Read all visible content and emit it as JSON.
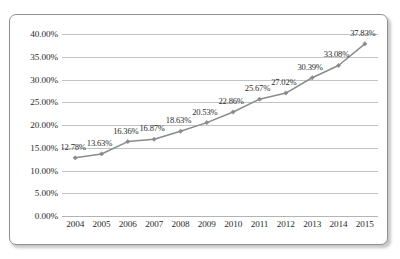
{
  "chart_data": {
    "type": "line",
    "title": "",
    "subtitle": "",
    "xlabel": "",
    "ylabel": "",
    "categories": [
      "2004",
      "2005",
      "2006",
      "2007",
      "2008",
      "2009",
      "2010",
      "2011",
      "2012",
      "2013",
      "2014",
      "2015"
    ],
    "values": [
      12.78,
      13.63,
      16.36,
      16.87,
      18.63,
      20.53,
      22.86,
      25.67,
      27.02,
      30.39,
      33.08,
      37.83
    ],
    "data_labels": [
      "12.78%",
      "13.63%",
      "16.36%",
      "16.87%",
      "18.63%",
      "20.53%",
      "22.86%",
      "25.67%",
      "27.02%",
      "30.39%",
      "33.08%",
      "37.83%"
    ],
    "series": [
      {
        "name": "",
        "values": [
          12.78,
          13.63,
          16.36,
          16.87,
          18.63,
          20.53,
          22.86,
          25.67,
          27.02,
          30.39,
          33.08,
          37.83
        ]
      }
    ],
    "ylim": [
      0,
      40
    ],
    "ytick_values": [
      0,
      5,
      10,
      15,
      20,
      25,
      30,
      35,
      40
    ],
    "ytick_labels": [
      "0.00%",
      "5.00%",
      "10.00%",
      "15.00%",
      "20.00%",
      "25.00%",
      "30.00%",
      "35.00%",
      "40.00%"
    ],
    "grid": true,
    "grid_axis": "y",
    "legend": false,
    "legend_position": "none",
    "marker": "diamond",
    "colors": {
      "line": "#8a8b8f",
      "marker": "#8a8b8f",
      "gridline": "#c2c3c6",
      "frame": "#8f9094",
      "text": "#2b2b2b",
      "background": "#ffffff"
    }
  }
}
